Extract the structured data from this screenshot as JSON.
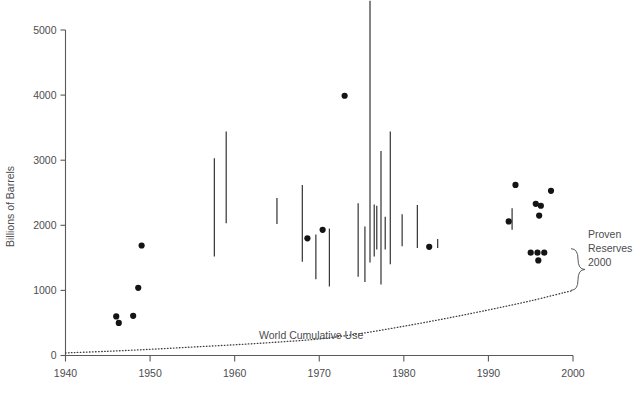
{
  "chart_data": {
    "type": "scatter",
    "title": "",
    "xlabel": "",
    "ylabel": "Billions of Barrels",
    "xlim": [
      1940,
      2000
    ],
    "ylim": [
      0,
      5000
    ],
    "xticks": [
      1940,
      1950,
      1960,
      1970,
      1980,
      1990,
      2000
    ],
    "xticklabels": [
      "1940",
      "1950",
      "1960",
      "1970",
      "1980",
      "1990",
      "2000"
    ],
    "yticks": [
      0,
      1000,
      2000,
      3000,
      4000,
      5000
    ],
    "yticklabels": [
      "0",
      "1000",
      "2000",
      "3000",
      "4000",
      "5000"
    ],
    "grid": false,
    "legend": false,
    "series": [
      {
        "name": "Point estimates of ultimately recoverable oil",
        "type": "scatter",
        "marker": "filled-circle",
        "color": "#141414",
        "points": [
          {
            "x": 1946.0,
            "y": 600
          },
          {
            "x": 1946.3,
            "y": 500
          },
          {
            "x": 1948.0,
            "y": 610
          },
          {
            "x": 1948.6,
            "y": 1040
          },
          {
            "x": 1949.0,
            "y": 1690
          },
          {
            "x": 1968.6,
            "y": 1800
          },
          {
            "x": 1970.4,
            "y": 1930
          },
          {
            "x": 1973.0,
            "y": 3990
          },
          {
            "x": 1983.0,
            "y": 1670
          },
          {
            "x": 1992.4,
            "y": 2060
          },
          {
            "x": 1993.2,
            "y": 2620
          },
          {
            "x": 1995.6,
            "y": 2330
          },
          {
            "x": 1996.2,
            "y": 2300
          },
          {
            "x": 1996.0,
            "y": 2150
          },
          {
            "x": 1997.4,
            "y": 2530
          },
          {
            "x": 1995.0,
            "y": 1580
          },
          {
            "x": 1995.8,
            "y": 1580
          },
          {
            "x": 1996.6,
            "y": 1580
          },
          {
            "x": 1995.9,
            "y": 1460
          }
        ]
      },
      {
        "name": "Range estimates of ultimately recoverable oil",
        "type": "range-bar",
        "color": "#3a3a3c",
        "bars": [
          {
            "x": 1957.6,
            "low": 1520,
            "high": 3030
          },
          {
            "x": 1959.0,
            "low": 2030,
            "high": 3440
          },
          {
            "x": 1965.0,
            "low": 2020,
            "high": 2420
          },
          {
            "x": 1968.0,
            "low": 1440,
            "high": 2620
          },
          {
            "x": 1969.6,
            "low": 1170,
            "high": 1860
          },
          {
            "x": 1971.2,
            "low": 1060,
            "high": 1950
          },
          {
            "x": 1974.6,
            "low": 1210,
            "high": 2340
          },
          {
            "x": 1975.4,
            "low": 1130,
            "high": 1980
          },
          {
            "x": 1976.0,
            "low": 1430,
            "high": 5450
          },
          {
            "x": 1976.5,
            "low": 1520,
            "high": 2320
          },
          {
            "x": 1976.8,
            "low": 1630,
            "high": 2300
          },
          {
            "x": 1977.3,
            "low": 1090,
            "high": 3140
          },
          {
            "x": 1977.8,
            "low": 1630,
            "high": 2130
          },
          {
            "x": 1978.4,
            "low": 1400,
            "high": 3440
          },
          {
            "x": 1979.8,
            "low": 1680,
            "high": 2170
          },
          {
            "x": 1981.6,
            "low": 1650,
            "high": 2310
          },
          {
            "x": 1984.0,
            "low": 1650,
            "high": 1790
          },
          {
            "x": 1992.8,
            "low": 1930,
            "high": 2260
          }
        ]
      },
      {
        "name": "World Cumulative Use",
        "type": "line",
        "style": "dotted",
        "color": "#3f3f41",
        "label": "World Cumulative Use",
        "points": [
          {
            "x": 1940,
            "y": 40
          },
          {
            "x": 1945,
            "y": 65
          },
          {
            "x": 1950,
            "y": 95
          },
          {
            "x": 1955,
            "y": 130
          },
          {
            "x": 1960,
            "y": 165
          },
          {
            "x": 1965,
            "y": 205
          },
          {
            "x": 1970,
            "y": 255
          },
          {
            "x": 1975,
            "y": 340
          },
          {
            "x": 1980,
            "y": 450
          },
          {
            "x": 1985,
            "y": 570
          },
          {
            "x": 1990,
            "y": 700
          },
          {
            "x": 1995,
            "y": 840
          },
          {
            "x": 2000,
            "y": 1000
          }
        ]
      }
    ],
    "annotations": [
      {
        "name": "world-cumulative-use-label",
        "text": "World Cumulative Use",
        "x": 1965.5,
        "y": 430
      },
      {
        "name": "proven-reserves-label",
        "text": "Proven\nReserves\n2000",
        "x": 2001.5,
        "y": 1300
      },
      {
        "name": "proven-reserves-brace",
        "text": "}",
        "from_y": 1000,
        "to_y": 1640
      }
    ]
  },
  "labels": {
    "y_axis_title": "Billions of Barrels",
    "world_cumulative_use": "World Cumulative Use",
    "proven_reserves_line1": "Proven",
    "proven_reserves_line2": "Reserves",
    "proven_reserves_line3": "2000"
  },
  "colors": {
    "axis": "#58595b",
    "text": "#4c4d4f",
    "dot": "#141414",
    "bar": "#3a3a3c",
    "curve": "#3f3f41",
    "background": "#ffffff"
  }
}
